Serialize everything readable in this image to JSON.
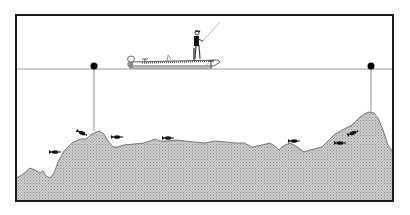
{
  "diagram": {
    "title": "",
    "colors": {
      "frame": "#1a1a1a",
      "waterline": "#9a9a9a",
      "bottom_fill": "#c8c8c8",
      "bottom_dots": "#8a8a8a",
      "bottom_outline": "#555555",
      "fish": "#111111",
      "buoy": "#000000",
      "buoy_line": "#777777",
      "background": "#ffffff"
    },
    "elements": {
      "boat": {
        "label": "bass-boat"
      },
      "angler": {
        "label": "angler-casting"
      },
      "buoys": [
        {
          "label": "marker-buoy-left"
        },
        {
          "label": "marker-buoy-right"
        }
      ],
      "fish_count": 7
    }
  }
}
